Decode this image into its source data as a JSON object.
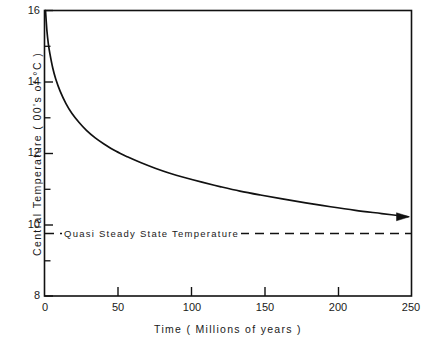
{
  "chart_data": {
    "type": "line",
    "title": "",
    "xlabel": "Time  ( Millions of years )",
    "ylabel": "Central  Temperature  ( 00's of  °C )",
    "xlim": [
      0,
      250
    ],
    "ylim": [
      8,
      16
    ],
    "xticks": [
      0,
      50,
      100,
      150,
      200,
      250
    ],
    "xtick_labels": [
      "0",
      "50",
      "100",
      "150",
      "200",
      "250"
    ],
    "yticks": [
      8,
      10,
      12,
      14,
      16
    ],
    "ytick_labels": [
      "8",
      "10",
      "12",
      "14",
      "16"
    ],
    "yminorticks": [
      9,
      11,
      13,
      15
    ],
    "grid": false,
    "legend": null,
    "series": [
      {
        "name": "Central Temperature",
        "line_color": "#111111",
        "line_style": "solid",
        "arrow_end": true,
        "x": [
          0,
          1,
          2,
          3,
          5,
          7,
          10,
          14,
          18,
          23,
          28,
          34,
          40,
          48,
          56,
          65,
          75,
          85,
          95,
          107,
          120,
          133,
          147,
          162,
          178,
          195,
          212,
          230,
          248
        ],
        "y": [
          16.0,
          15.42,
          15.05,
          14.79,
          14.38,
          14.08,
          13.74,
          13.39,
          13.12,
          12.86,
          12.64,
          12.43,
          12.26,
          12.06,
          11.9,
          11.74,
          11.58,
          11.44,
          11.32,
          11.19,
          11.06,
          10.94,
          10.83,
          10.72,
          10.61,
          10.5,
          10.4,
          10.31,
          10.22
        ]
      }
    ],
    "reference_lines": [
      {
        "name": "quasi-steady-state",
        "label": "Quasi  Steady  State  Temperature",
        "orientation": "horizontal",
        "value": 9.75,
        "line_style": "dashed",
        "line_color": "#111111"
      }
    ],
    "frame_color": "#111111",
    "background_color": "#ffffff"
  }
}
